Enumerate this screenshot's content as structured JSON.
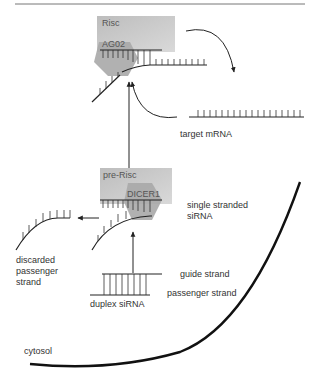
{
  "diagram": {
    "type": "siRNA processing pathway",
    "components": {
      "risc": {
        "label": "Risc",
        "color": "#c8c8c8"
      },
      "ago2": {
        "label": "AG02",
        "color": "#a8a8a8"
      },
      "pre_risc": {
        "label": "pre-Risc",
        "color": "#c8c8c8"
      },
      "dicer1": {
        "label": "DICER1",
        "color": "#a8a8a8"
      }
    },
    "labels": {
      "target_mrna": "target mRNA",
      "single_stranded_line1": "single stranded",
      "single_stranded_line2": "siRNA",
      "discarded_line1": "discarded",
      "discarded_line2": "passenger",
      "discarded_line3": "strand",
      "guide_strand": "guide strand",
      "passenger_strand": "passenger strand",
      "duplex_sirna": "duplex siRNA",
      "cytosol": "cytosol"
    },
    "flow": [
      "duplex siRNA",
      "pre-Risc (DICER1)",
      "single stranded siRNA + discarded passenger strand",
      "Risc (AG02) binds target mRNA",
      "target mRNA released"
    ],
    "colors": {
      "line": "#222222",
      "membrane": "#111111",
      "rule": "#777777"
    }
  }
}
